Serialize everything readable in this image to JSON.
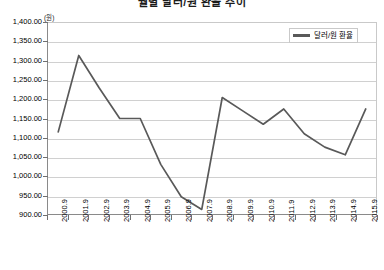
{
  "chart_data": {
    "type": "line",
    "title": "월별 달러/원 환율 추이",
    "xlabel": "",
    "ylabel": "",
    "y_unit_label": "(원)",
    "grid": true,
    "legend_position": "top-right",
    "ylim": [
      900,
      1400
    ],
    "ytick_step": 50,
    "yticks": [
      1400,
      1350,
      1300,
      1250,
      1200,
      1150,
      1100,
      1050,
      1000,
      950,
      900
    ],
    "ytick_labels": [
      "1,400.00",
      "1,350.00",
      "1,300.00",
      "1,250.00",
      "1,200.00",
      "1,150.00",
      "1,100.00",
      "1,050.00",
      "1,000.00",
      "950.00",
      "900.00"
    ],
    "categories": [
      "2000.9",
      "2001.9",
      "2002.9",
      "2003.9",
      "2004.9",
      "2005.9",
      "2006.9",
      "2007.9",
      "2008.9",
      "2009.9",
      "2010.9",
      "2011.9",
      "2012.9",
      "2013.9",
      "2014.9",
      "2015.9"
    ],
    "series": [
      {
        "name": "달러/원 환율",
        "color": "#595959",
        "values": [
          1115,
          1315,
          1230,
          1150,
          1150,
          1030,
          945,
          912,
          1205,
          1170,
          1135,
          1175,
          1110,
          1075,
          1055,
          1175
        ]
      }
    ]
  },
  "legend": {
    "entries": [
      {
        "label": "달러/원 환율",
        "color": "#595959"
      }
    ]
  }
}
